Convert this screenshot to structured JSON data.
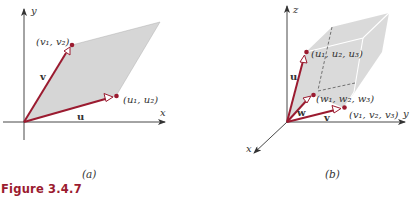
{
  "figure": {
    "caption": "Figure 3.4.7",
    "colors": {
      "vector": "#9b1b30",
      "fill": "#d6d6d6",
      "axis": "#333333",
      "caption": "#9b1b30"
    },
    "panel_a": {
      "sublabel": "(a)",
      "axes": {
        "x": "x",
        "y": "y"
      },
      "vectors": {
        "u": {
          "name": "u",
          "point_label": "(u₁, u₂)"
        },
        "v": {
          "name": "v",
          "point_label": "(v₁, v₂)"
        }
      },
      "shape": "parallelogram"
    },
    "panel_b": {
      "sublabel": "(b)",
      "axes": {
        "x": "x",
        "y": "y",
        "z": "z"
      },
      "vectors": {
        "u": {
          "name": "u",
          "point_label": "(u₁, u₂, u₃)"
        },
        "v": {
          "name": "v",
          "point_label": "(v₁, v₂, v₃)"
        },
        "w": {
          "name": "w",
          "point_label": "(w₁, w₂, w₃)"
        }
      },
      "shape": "parallelepiped"
    }
  }
}
